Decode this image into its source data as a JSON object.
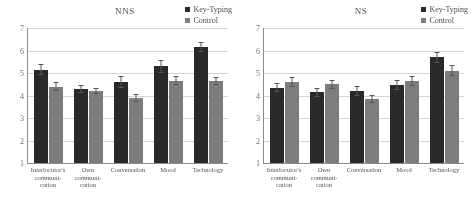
{
  "legend": {
    "series": [
      {
        "label": "Key-Typing",
        "color": "#262626"
      },
      {
        "label": "Control",
        "color": "#7d7d7d"
      }
    ]
  },
  "panels": [
    {
      "title": "NNS",
      "yticks": [
        "7",
        "6",
        "5",
        "4",
        "3",
        "2",
        "1"
      ],
      "categories": [
        "Interlocutor's communi-cation",
        "Own communi-cation",
        "Conversation",
        "Mood",
        "Technology"
      ]
    },
    {
      "title": "NS",
      "yticks": [
        "7",
        "6",
        "5",
        "4",
        "3",
        "2",
        "1"
      ],
      "categories": [
        "Interlocutor's communi-cation",
        "Own communi-cation",
        "Conversation",
        "Mood",
        "Technology"
      ]
    }
  ],
  "chart_data": [
    {
      "type": "bar",
      "title": "NNS",
      "xlabel": "",
      "ylabel": "",
      "ylim": [
        1,
        7
      ],
      "yticks": [
        1,
        2,
        3,
        4,
        5,
        6,
        7
      ],
      "grid": true,
      "legend_position": "top-right",
      "categories": [
        "Interlocutor's communication",
        "Own communication",
        "Conversation",
        "Mood",
        "Technology"
      ],
      "series": [
        {
          "name": "Key-Typing",
          "color": "#262626",
          "values": [
            5.15,
            4.3,
            4.6,
            5.3,
            6.15
          ],
          "errors": [
            0.25,
            0.18,
            0.25,
            0.28,
            0.22
          ]
        },
        {
          "name": "Control",
          "color": "#7d7d7d",
          "values": [
            4.4,
            4.2,
            3.9,
            4.65,
            4.65
          ],
          "errors": [
            0.2,
            0.15,
            0.18,
            0.2,
            0.18
          ]
        }
      ]
    },
    {
      "type": "bar",
      "title": "NS",
      "xlabel": "",
      "ylabel": "",
      "ylim": [
        1,
        7
      ],
      "yticks": [
        1,
        2,
        3,
        4,
        5,
        6,
        7
      ],
      "grid": true,
      "legend_position": "top-right",
      "categories": [
        "Interlocutor's communication",
        "Own communication",
        "Conversation",
        "Mood",
        "Technology"
      ],
      "series": [
        {
          "name": "Key-Typing",
          "color": "#262626",
          "values": [
            4.35,
            4.15,
            4.2,
            4.45,
            5.7
          ],
          "errors": [
            0.2,
            0.2,
            0.22,
            0.22,
            0.25
          ]
        },
        {
          "name": "Control",
          "color": "#7d7d7d",
          "values": [
            4.6,
            4.5,
            3.85,
            4.65,
            5.1
          ],
          "errors": [
            0.22,
            0.2,
            0.18,
            0.22,
            0.25
          ]
        }
      ]
    }
  ]
}
